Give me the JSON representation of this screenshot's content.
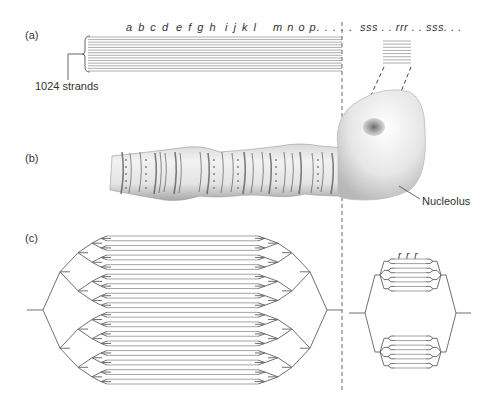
{
  "panels": {
    "a": {
      "label": "(a)",
      "gene_labels": [
        {
          "text": "a b c d",
          "x": 126,
          "y": 21
        },
        {
          "text": "e f g h",
          "x": 176,
          "y": 21
        },
        {
          "text": "i j k l",
          "x": 225,
          "y": 21
        },
        {
          "text": "m n o p. . . . .",
          "x": 273,
          "y": 21
        },
        {
          "text": "sss . . rrr . . sss. . .",
          "x": 360,
          "y": 21
        }
      ],
      "strand_count_label": "1024 strands",
      "bundle": {
        "x1": 88,
        "x2": 342,
        "y1": 37,
        "y2": 71,
        "lines": 14
      },
      "inset_bundle": {
        "x1": 383,
        "x2": 411,
        "y1": 41,
        "y2": 63,
        "lines": 8
      }
    },
    "b": {
      "label": "(b)",
      "callout": "Nucleolus"
    },
    "c": {
      "label": "(c)",
      "rrr_label": "r r r",
      "left_tree": {
        "root_y": 313,
        "root_x": 27,
        "levels": 4,
        "leaf_top": 236,
        "leaf_bottom": 384,
        "strand_x1": 107,
        "strand_x2": 258,
        "right_root_x": 342
      },
      "right_tree": {
        "center_x": 420,
        "root_y": 313,
        "clusters": 2,
        "leaves_per_cluster": 4
      }
    }
  },
  "divider": {
    "x": 342,
    "y1": 22,
    "y2": 390
  },
  "colors": {
    "line": "#666666",
    "strand": "#9a9a9a",
    "nucleolus_dark": "#666666",
    "chromosome_band": "#555555"
  }
}
